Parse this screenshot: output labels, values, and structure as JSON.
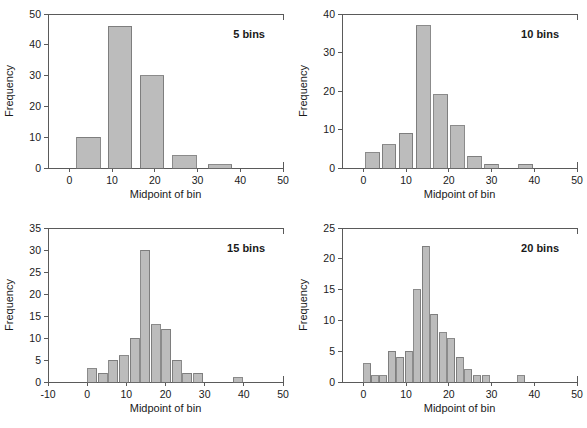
{
  "figure": {
    "background": "#ffffff",
    "bar_fill": "#bcbcbc",
    "bar_stroke": "#6e6e6e",
    "axis_color": "#5a5a5a"
  },
  "chart_data": [
    {
      "type": "bar",
      "title": "5 bins",
      "xlabel": "Midpoint of bin",
      "ylabel": "Frequency",
      "xlim": [
        -5,
        50
      ],
      "ylim": [
        0,
        50
      ],
      "xticks": [
        0,
        10,
        20,
        30,
        40,
        50
      ],
      "yticks": [
        0,
        10,
        20,
        30,
        40,
        50
      ],
      "grid": false,
      "bin_width": 5.5,
      "categories": [
        4.5,
        11.8,
        19.3,
        27.0,
        35.2
      ],
      "values": [
        10,
        46,
        30,
        4,
        1
      ]
    },
    {
      "type": "bar",
      "title": "10 bins",
      "xlabel": "Midpoint of bin",
      "ylabel": "Frequency",
      "xlim": [
        -5,
        50
      ],
      "ylim": [
        0,
        40
      ],
      "xticks": [
        0,
        10,
        20,
        30,
        40,
        50
      ],
      "yticks": [
        0,
        10,
        20,
        30,
        40
      ],
      "grid": false,
      "bin_width": 3.2,
      "categories": [
        2.2,
        6.0,
        10.0,
        14.0,
        18.1,
        22.0,
        26.0,
        30.0,
        34.0,
        38.0
      ],
      "values": [
        4,
        6,
        9,
        37,
        19,
        11,
        3,
        1,
        0,
        1
      ]
    },
    {
      "type": "bar",
      "title": "15 bins",
      "xlabel": "Midpoint of bin",
      "ylabel": "Frequency",
      "xlim": [
        -10,
        50
      ],
      "ylim": [
        0,
        35
      ],
      "xticks": [
        -10,
        0,
        10,
        20,
        30,
        40,
        50
      ],
      "yticks": [
        0,
        5,
        10,
        15,
        20,
        25,
        30,
        35
      ],
      "grid": false,
      "bin_width": 2.3,
      "categories": [
        1.3,
        4.0,
        6.7,
        9.4,
        12.1,
        14.8,
        17.5,
        20.2,
        22.9,
        25.6,
        28.3,
        31.0,
        33.7,
        38.5
      ],
      "values": [
        3,
        2,
        5,
        6,
        10,
        30,
        13,
        12,
        5,
        2,
        2,
        0,
        0,
        1
      ]
    },
    {
      "type": "bar",
      "title": "20 bins",
      "xlabel": "Midpoint of bin",
      "ylabel": "Frequency",
      "xlim": [
        -5,
        50
      ],
      "ylim": [
        0,
        25
      ],
      "xticks": [
        0,
        10,
        20,
        30,
        40,
        50
      ],
      "yticks": [
        0,
        5,
        10,
        15,
        20,
        25
      ],
      "grid": false,
      "bin_width": 1.65,
      "categories": [
        0.9,
        2.7,
        4.6,
        6.7,
        8.6,
        10.6,
        12.6,
        14.6,
        16.6,
        18.6,
        20.6,
        22.6,
        24.6,
        26.6,
        28.6,
        30.6,
        32.6,
        36.9
      ],
      "values": [
        3,
        1,
        1,
        5,
        4,
        5,
        15,
        22,
        11,
        8,
        7,
        4,
        2,
        1,
        1,
        0,
        0,
        1
      ]
    }
  ]
}
